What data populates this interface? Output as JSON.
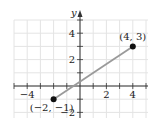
{
  "chart_data": {
    "type": "line",
    "title": "",
    "xlabel": "",
    "ylabel": "y",
    "xlim": [
      -5,
      5
    ],
    "ylim": [
      -2,
      5
    ],
    "grid": true,
    "x_ticks": [
      -4,
      2,
      4
    ],
    "x_tick_labels": [
      "−4",
      "2",
      "4"
    ],
    "y_ticks": [
      4,
      2,
      -2
    ],
    "y_tick_labels": [
      "4",
      "2",
      "−2"
    ],
    "series": [
      {
        "name": "segment",
        "points": [
          [
            -2,
            -1
          ],
          [
            4,
            3
          ]
        ]
      }
    ],
    "annotations": [
      {
        "x": -2,
        "y": -1,
        "text": "(−2, −1)"
      },
      {
        "x": 4,
        "y": 3,
        "text": "(4, 3)"
      }
    ],
    "colors": {
      "segment": "#9a9a9a",
      "point": "#111111",
      "grid": "#e4e4e4",
      "axis": "#333333"
    }
  }
}
